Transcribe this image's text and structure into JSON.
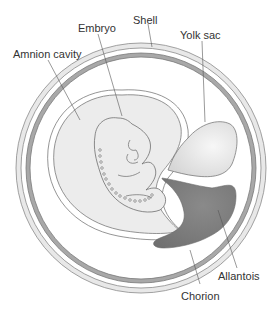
{
  "labels": {
    "shell": "Shell",
    "embryo": "Embryo",
    "yolk_sac": "Yolk sac",
    "amnion_cavity": "Amnion cavity",
    "allantois": "Allantois",
    "chorion": "Chorion"
  },
  "colors": {
    "shell_band": "#e6e6e6",
    "chorion_band": "#a9a9a9",
    "amnion_fill": "#ececec",
    "yolk_fill": "#e4e4e4",
    "allantois_fill": "#7d7d7d",
    "outline": "#7a7a7a",
    "text": "#333333"
  }
}
